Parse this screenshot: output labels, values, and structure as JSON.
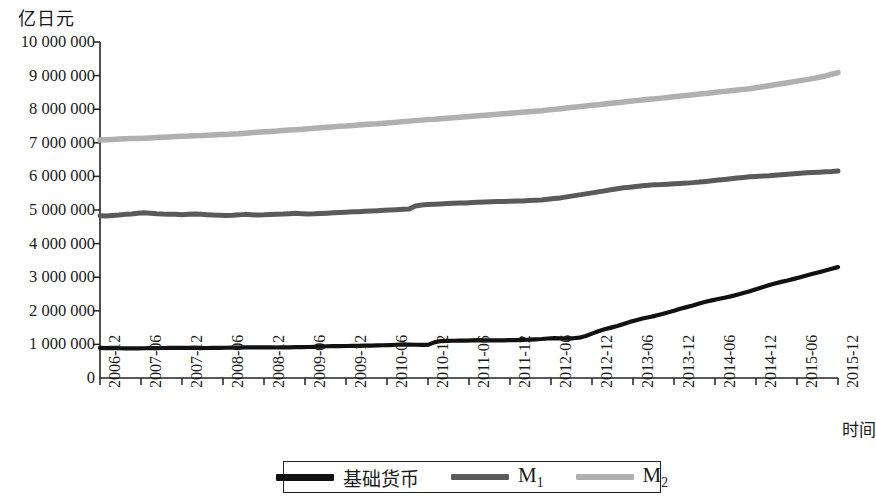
{
  "chart_data": {
    "type": "line",
    "title": "",
    "ylabel": "亿日元",
    "xlabel": "时间",
    "ylim": [
      0,
      10000000
    ],
    "ytick_labels": [
      "10 000 000",
      "9 000 000",
      "8 000 000",
      "7 000 000",
      "6 000 000",
      "5 000 000",
      "4 000 000",
      "3 000 000",
      "2 000 000",
      "1 000 000",
      "0"
    ],
    "ytick_values": [
      10000000,
      9000000,
      8000000,
      7000000,
      6000000,
      5000000,
      4000000,
      3000000,
      2000000,
      1000000,
      0
    ],
    "grid": false,
    "legend_position": "bottom-outside",
    "categories": [
      "2006-12",
      "2007-06",
      "2007-12",
      "2008-06",
      "2008-12",
      "2009-06",
      "2009-12",
      "2010-06",
      "2010-12",
      "2011-06",
      "2011-12",
      "2012-06",
      "2012-12",
      "2013-06",
      "2013-12",
      "2014-06",
      "2014-12",
      "2015-06",
      "2015-12"
    ],
    "x_start": "2006-12",
    "x_end": "2015-12",
    "x_step_months": 6,
    "series": [
      {
        "name": "基础货币",
        "color": "#111111",
        "width": 4.2,
        "monthly_values": [
          895000,
          890000,
          888000,
          886000,
          884000,
          882000,
          884000,
          886000,
          888000,
          890000,
          893000,
          896000,
          900000,
          898000,
          896000,
          894000,
          892000,
          893000,
          896000,
          898000,
          900000,
          903000,
          906000,
          910000,
          915000,
          912000,
          910000,
          909000,
          908000,
          910000,
          913000,
          916000,
          919000,
          922000,
          927000,
          935000,
          945000,
          948000,
          950000,
          952000,
          955000,
          958000,
          962000,
          966000,
          970000,
          974000,
          980000,
          990000,
          1000000,
          995000,
          990000,
          988000,
          986000,
          1060000,
          1100000,
          1105000,
          1108000,
          1110000,
          1115000,
          1120000,
          1125000,
          1122000,
          1120000,
          1118000,
          1120000,
          1125000,
          1130000,
          1135000,
          1140000,
          1150000,
          1160000,
          1175000,
          1185000,
          1180000,
          1178000,
          1182000,
          1200000,
          1250000,
          1320000,
          1390000,
          1450000,
          1500000,
          1550000,
          1610000,
          1670000,
          1720000,
          1770000,
          1810000,
          1850000,
          1900000,
          1950000,
          2000000,
          2060000,
          2110000,
          2160000,
          2220000,
          2270000,
          2310000,
          2350000,
          2390000,
          2430000,
          2480000,
          2530000,
          2580000,
          2640000,
          2700000,
          2760000,
          2810000,
          2860000,
          2900000,
          2950000,
          3000000,
          3050000,
          3100000,
          3150000,
          3200000,
          3250000,
          3300000
        ]
      },
      {
        "name": "M1",
        "color": "#5a5a5a",
        "width": 5.0,
        "monthly_values": [
          4830000,
          4820000,
          4835000,
          4850000,
          4870000,
          4880000,
          4900000,
          4920000,
          4905000,
          4890000,
          4880000,
          4875000,
          4870000,
          4860000,
          4870000,
          4880000,
          4870000,
          4860000,
          4850000,
          4845000,
          4840000,
          4845000,
          4855000,
          4870000,
          4860000,
          4850000,
          4855000,
          4865000,
          4875000,
          4880000,
          4890000,
          4900000,
          4890000,
          4880000,
          4885000,
          4895000,
          4905000,
          4915000,
          4925000,
          4935000,
          4945000,
          4950000,
          4960000,
          4970000,
          4980000,
          4990000,
          5000000,
          5010000,
          5020000,
          5030000,
          5120000,
          5150000,
          5160000,
          5170000,
          5180000,
          5190000,
          5200000,
          5205000,
          5210000,
          5220000,
          5230000,
          5240000,
          5245000,
          5250000,
          5255000,
          5260000,
          5265000,
          5270000,
          5280000,
          5290000,
          5300000,
          5320000,
          5340000,
          5360000,
          5390000,
          5420000,
          5450000,
          5480000,
          5510000,
          5540000,
          5570000,
          5600000,
          5630000,
          5660000,
          5680000,
          5700000,
          5720000,
          5740000,
          5755000,
          5760000,
          5770000,
          5780000,
          5790000,
          5800000,
          5815000,
          5830000,
          5850000,
          5870000,
          5890000,
          5910000,
          5930000,
          5950000,
          5970000,
          5990000,
          6000000,
          6010000,
          6020000,
          6035000,
          6050000,
          6065000,
          6080000,
          6095000,
          6105000,
          6115000,
          6125000,
          6135000,
          6145000,
          6160000
        ]
      },
      {
        "name": "M2",
        "color": "#b0b0b0",
        "width": 5.5,
        "monthly_values": [
          7080000,
          7090000,
          7100000,
          7110000,
          7120000,
          7130000,
          7125000,
          7135000,
          7145000,
          7155000,
          7165000,
          7175000,
          7185000,
          7195000,
          7200000,
          7210000,
          7215000,
          7225000,
          7235000,
          7245000,
          7250000,
          7260000,
          7270000,
          7285000,
          7300000,
          7315000,
          7330000,
          7340000,
          7350000,
          7365000,
          7380000,
          7390000,
          7400000,
          7415000,
          7430000,
          7445000,
          7460000,
          7475000,
          7490000,
          7500000,
          7515000,
          7530000,
          7545000,
          7560000,
          7570000,
          7585000,
          7600000,
          7615000,
          7630000,
          7645000,
          7660000,
          7675000,
          7690000,
          7700000,
          7715000,
          7730000,
          7745000,
          7760000,
          7775000,
          7790000,
          7805000,
          7820000,
          7835000,
          7850000,
          7865000,
          7880000,
          7895000,
          7910000,
          7925000,
          7940000,
          7955000,
          7975000,
          7995000,
          8015000,
          8035000,
          8055000,
          8075000,
          8095000,
          8115000,
          8135000,
          8155000,
          8175000,
          8195000,
          8215000,
          8235000,
          8255000,
          8275000,
          8295000,
          8310000,
          8330000,
          8350000,
          8370000,
          8390000,
          8410000,
          8430000,
          8450000,
          8470000,
          8490000,
          8510000,
          8530000,
          8550000,
          8570000,
          8590000,
          8610000,
          8640000,
          8670000,
          8700000,
          8730000,
          8760000,
          8790000,
          8820000,
          8850000,
          8880000,
          8910000,
          8950000,
          8990000,
          9040000,
          9090000
        ]
      }
    ]
  },
  "legend": {
    "items": [
      {
        "label": "基础货币",
        "color": "#111111",
        "sub": ""
      },
      {
        "label": "M",
        "color": "#5a5a5a",
        "sub": "1"
      },
      {
        "label": "M",
        "color": "#b0b0b0",
        "sub": "2"
      }
    ]
  },
  "axes": {
    "y_title": "亿日元",
    "x_title": "时间"
  }
}
